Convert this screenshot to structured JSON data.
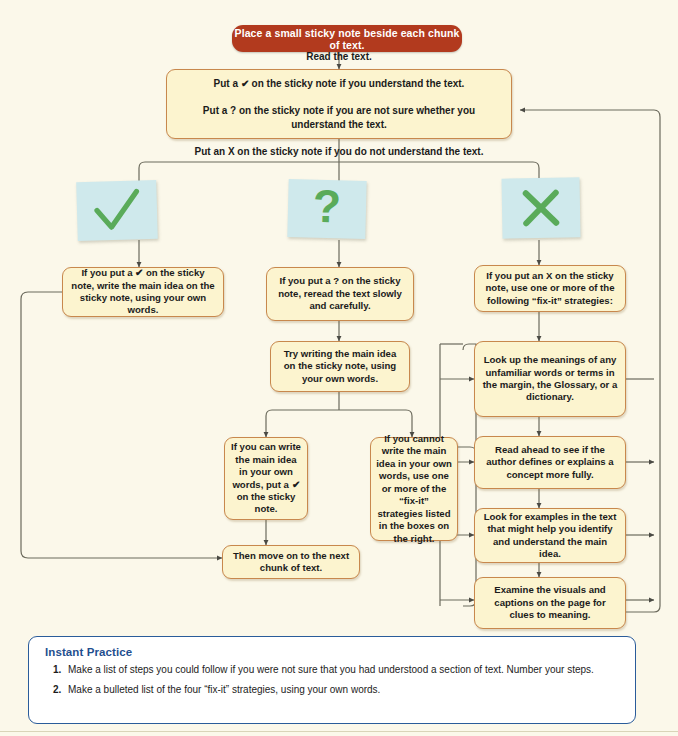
{
  "page": {
    "background_color": "#fbf8ea",
    "accent_red": "#b23a1e",
    "box_fill": "#fcf4cf",
    "box_border": "#c8884d",
    "sticky_fill": "#cfe9ec",
    "symbol_green": "#5aab5a",
    "practice_border": "#2a5c9a",
    "practice_title_color": "#1f4f8f"
  },
  "flowchart": {
    "type": "flowchart",
    "start": {
      "id": "start",
      "text": "Place a small sticky note beside each chunk of text."
    },
    "decision": {
      "id": "read-text",
      "lines": [
        "Read the text.",
        "Put a ✔ on the sticky note if you understand the text.",
        "Put a ? on the sticky note if you are not sure whether you understand the text.",
        "Put an X on the sticky note if you do not understand the text."
      ]
    },
    "stickies": [
      {
        "id": "sticky-check",
        "symbol": "check",
        "label": "check-mark"
      },
      {
        "id": "sticky-question",
        "symbol": "question",
        "label": "question-mark"
      },
      {
        "id": "sticky-x",
        "symbol": "x",
        "label": "x-mark"
      }
    ],
    "branches": [
      {
        "id": "branch-check",
        "text": "If you put a ✔ on the sticky note, write the  main idea on the sticky note, using your own  words."
      },
      {
        "id": "branch-question",
        "text": "If you put a ? on the sticky note, reread the text slowly and carefully."
      },
      {
        "id": "branch-x",
        "text": "If you put an X on the sticky note, use one or more of the following “fix-it” strategies:"
      }
    ],
    "middle": {
      "try_writing": "Try writing the main idea on the sticky note, using your own words.",
      "can_write": "If you can write the main idea in your own words, put a ✔ on the sticky note.",
      "cannot_write": "If you cannot write the main idea in your own words, use one or more of the “fix-it” strategies listed in the boxes on the right.",
      "move_on": "Then move on to the next chunk of text."
    },
    "strategies": [
      {
        "id": "strategy-1",
        "text": "Look up the meanings of any unfamiliar words or terms in the margin, the Glossary, or a dictionary."
      },
      {
        "id": "strategy-2",
        "text": "Read ahead to see if the author defines or explains a concept more fully."
      },
      {
        "id": "strategy-3",
        "text": "Look for examples in the text that might help you identify and understand the main idea."
      },
      {
        "id": "strategy-4",
        "text": "Examine the visuals and captions on the page for clues to meaning."
      }
    ]
  },
  "instant_practice": {
    "title": "Instant Practice",
    "items": [
      {
        "number": "1.",
        "text": "Make a list of steps you could follow if you were not sure that you had understood a section of text. Number your steps."
      },
      {
        "number": "2.",
        "text": "Make a bulleted list of the four “fix-it” strategies, using your own words."
      }
    ]
  }
}
